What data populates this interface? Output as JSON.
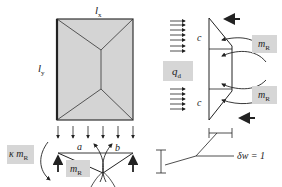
{
  "diagram": {
    "type": "yield-line slab mechanism",
    "colors": {
      "slab_fill": "#d4d4d4",
      "label_box": "#d6d6d6",
      "line": "#222222"
    },
    "labels": {
      "lx": {
        "main": "l",
        "sub": "x"
      },
      "ly": {
        "main": "l",
        "sub": "y"
      },
      "qd": {
        "main": "q",
        "sub": "d"
      },
      "kappa_mR": {
        "main": "κ m",
        "sub": "R"
      },
      "mR_bottom": {
        "main": "m",
        "sub": "R"
      },
      "mR_right_top": {
        "main": "m",
        "sub": "R"
      },
      "mR_right_bottom": {
        "main": "m",
        "sub": "R"
      },
      "a": "a",
      "b": "b",
      "c_top": "c",
      "c_bottom": "c",
      "delta_w": "δw = 1"
    }
  }
}
